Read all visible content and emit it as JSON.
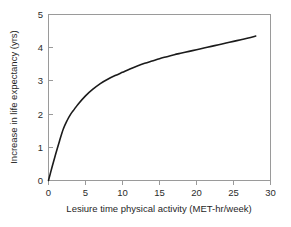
{
  "chart_data": {
    "type": "line",
    "title": "",
    "xlabel": "Lesiure time physical activity (MET-hr/week)",
    "ylabel": "Increase in life expectancy (yrs)",
    "xlim": [
      0,
      30
    ],
    "ylim": [
      0,
      5
    ],
    "xticks": [
      "0",
      "5",
      "10",
      "15",
      "20",
      "25",
      "30"
    ],
    "yticks": [
      "0",
      "1",
      "2",
      "3",
      "4",
      "5"
    ],
    "xtick_values": [
      0,
      5,
      10,
      15,
      20,
      25,
      30
    ],
    "ytick_values": [
      0,
      1,
      2,
      3,
      4,
      5
    ],
    "grid": false,
    "legend": false,
    "legend_position": "none",
    "series": [
      {
        "name": "Increase in life expectancy",
        "color": "#1b1b1b",
        "x": [
          0,
          0.5,
          1,
          1.5,
          2,
          2.5,
          3,
          3.5,
          4,
          5,
          6,
          7,
          8,
          9,
          10,
          11,
          12,
          13,
          14,
          15,
          16,
          17,
          18,
          19,
          20,
          21,
          22,
          23,
          24,
          25,
          26,
          27,
          28
        ],
        "values": [
          0,
          0.42,
          0.82,
          1.2,
          1.55,
          1.8,
          2.0,
          2.15,
          2.3,
          2.55,
          2.75,
          2.92,
          3.05,
          3.16,
          3.26,
          3.36,
          3.45,
          3.53,
          3.6,
          3.67,
          3.73,
          3.79,
          3.84,
          3.89,
          3.94,
          3.99,
          4.04,
          4.09,
          4.14,
          4.19,
          4.24,
          4.29,
          4.35
        ]
      }
    ]
  },
  "axes": {
    "x_title": "Lesiure time physical activity (MET-hr/week)",
    "y_title": "Increase in life expectancy (yrs)"
  },
  "ticks": {
    "x": [
      "0",
      "5",
      "10",
      "15",
      "20",
      "25",
      "30"
    ],
    "y": [
      "0",
      "1",
      "2",
      "3",
      "4",
      "5"
    ]
  }
}
